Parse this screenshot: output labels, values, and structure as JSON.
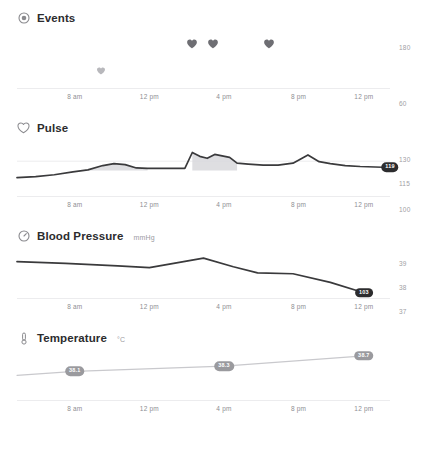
{
  "panels": [
    {
      "key": "events",
      "title": "Events",
      "unit": "",
      "icon": "record-circle-icon"
    },
    {
      "key": "pulse",
      "title": "Pulse",
      "unit": "",
      "icon": "heart-outline-icon"
    },
    {
      "key": "blood_pressure",
      "title": "Blood Pressure",
      "unit": "mmHg",
      "icon": "gauge-icon"
    },
    {
      "key": "temperature",
      "title": "Temperature",
      "unit": "°C",
      "icon": "thermometer-icon"
    }
  ],
  "xticks": [
    "8 am",
    "12 pm",
    "4 pm",
    "8 pm",
    "12 pm"
  ],
  "colors": {
    "line": "#3a3a3c",
    "line_light": "#c9c9cd",
    "fill": "#d8d8dc",
    "badge_dark": "#2c2c2e",
    "badge_gray": "#9a9a9e",
    "grid": "#ececee",
    "heart_dark": "#6e6e73",
    "heart_light": "#b8b8bc",
    "axis_text": "#8e8e93"
  },
  "chart_data": [
    {
      "type": "scatter",
      "key": "events",
      "title": "Events",
      "xlabel": "",
      "ylabel": "",
      "xticklabels": [
        "8 am",
        "12 pm",
        "4 pm",
        "8 pm",
        "12 pm"
      ],
      "xtick_positions": [
        0.155,
        0.355,
        0.555,
        0.755,
        0.93
      ],
      "grid": false,
      "markers": [
        {
          "x": 0.225,
          "y": 0.72,
          "shade": "light",
          "size": 9
        },
        {
          "x": 0.47,
          "y": 0.26,
          "shade": "dark",
          "size": 11
        },
        {
          "x": 0.525,
          "y": 0.26,
          "shade": "dark",
          "size": 11
        },
        {
          "x": 0.675,
          "y": 0.26,
          "shade": "dark",
          "size": 11
        }
      ]
    },
    {
      "type": "area",
      "key": "pulse",
      "title": "Pulse",
      "xlabel": "",
      "ylabel": "",
      "ylim": [
        60,
        180
      ],
      "yticklabels": [
        "180",
        "60"
      ],
      "ytick_values": [
        180,
        60
      ],
      "xticklabels": [
        "8 am",
        "12 pm",
        "4 pm",
        "8 pm",
        "12 pm"
      ],
      "grid": true,
      "end_badge": "119",
      "x": [
        0.0,
        0.05,
        0.1,
        0.15,
        0.19,
        0.23,
        0.26,
        0.29,
        0.32,
        0.35,
        0.4,
        0.45,
        0.47,
        0.49,
        0.51,
        0.53,
        0.55,
        0.57,
        0.59,
        0.62,
        0.66,
        0.7,
        0.74,
        0.78,
        0.81,
        0.84,
        0.88,
        0.92,
        0.96,
        1.0
      ],
      "y": [
        98,
        100,
        104,
        110,
        114,
        123,
        127,
        125,
        118,
        117,
        117,
        117,
        150,
        142,
        138,
        146,
        143,
        140,
        128,
        126,
        124,
        124,
        128,
        145,
        131,
        127,
        123,
        121,
        120,
        119
      ],
      "shaded_segments": [
        [
          0.19,
          0.35
        ],
        [
          0.47,
          0.59
        ]
      ]
    },
    {
      "type": "line",
      "key": "blood_pressure",
      "title": "Blood Pressure",
      "unit": "mmHg",
      "xlabel": "",
      "ylabel": "",
      "ylim": [
        100,
        130
      ],
      "yticklabels": [
        "130",
        "115",
        "100"
      ],
      "ytick_values": [
        130,
        115,
        100
      ],
      "xticklabels": [
        "8 am",
        "12 pm",
        "4 pm",
        "8 pm",
        "12 pm"
      ],
      "grid": false,
      "end_badge": "103",
      "x": [
        0.0,
        0.13,
        0.27,
        0.355,
        0.42,
        0.5,
        0.58,
        0.645,
        0.74,
        0.84,
        0.93
      ],
      "y": [
        121,
        120,
        118.5,
        117.5,
        120,
        123,
        118,
        114.5,
        114,
        109,
        103
      ]
    },
    {
      "type": "line",
      "key": "temperature",
      "title": "Temperature",
      "unit": "°C",
      "xlabel": "",
      "ylabel": "",
      "ylim": [
        37,
        39
      ],
      "yticklabels": [
        "39",
        "38",
        "37"
      ],
      "ytick_values": [
        39,
        38,
        37
      ],
      "xticklabels": [
        "8 am",
        "12 pm",
        "4 pm",
        "8 pm",
        "12 pm"
      ],
      "grid": false,
      "x": [
        0.0,
        0.155,
        0.555,
        0.93
      ],
      "y": [
        37.95,
        38.1,
        38.3,
        38.7
      ],
      "point_badges": [
        {
          "x": 0.155,
          "value": "38.1"
        },
        {
          "x": 0.555,
          "value": "38.3"
        },
        {
          "x": 0.93,
          "value": "38.7"
        }
      ]
    }
  ]
}
